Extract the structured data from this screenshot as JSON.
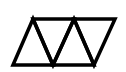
{
  "diagram": {
    "stroke_color": "#000000",
    "background": "#ffffff",
    "stroke_width": 3.5,
    "vertices": {
      "top_left": [
        33,
        19
      ],
      "top_middle": [
        74,
        19
      ],
      "top_right": [
        115,
        19
      ],
      "bottom_left": [
        13,
        65
      ],
      "bottom_middle": [
        53,
        65
      ],
      "bottom_right": [
        94,
        65
      ]
    },
    "triangle_count": 3
  }
}
